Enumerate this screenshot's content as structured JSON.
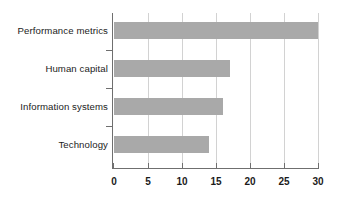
{
  "chart_data": {
    "type": "bar",
    "orientation": "horizontal",
    "title": "",
    "xlabel": "",
    "ylabel": "",
    "categories": [
      "Performance metrics",
      "Human capital",
      "Information systems",
      "Technology"
    ],
    "values": [
      30,
      17,
      16,
      14
    ],
    "series": [
      {
        "name": "",
        "values": [
          30,
          17,
          16,
          14
        ]
      }
    ],
    "xlim": [
      0,
      30
    ],
    "ylim": null,
    "xticks": [
      0,
      5,
      10,
      15,
      20,
      25,
      30
    ],
    "xtick_labels": [
      "0",
      "5",
      "10",
      "15",
      "20",
      "25",
      "30"
    ],
    "grid": "vertical",
    "legend": null,
    "bar_color": "#a9a9a9",
    "axis_color": "#6f6f6f",
    "grid_color": "#d2d2d2",
    "background_color": "#ffffff"
  }
}
